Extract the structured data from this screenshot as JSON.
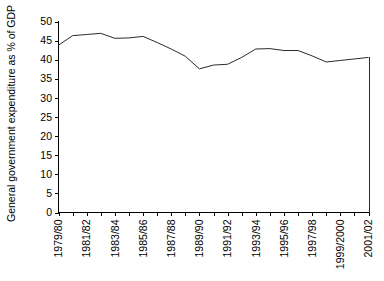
{
  "chart_data": {
    "type": "line",
    "title": "",
    "xlabel": "",
    "ylabel": "General government expenditure as % of GDP",
    "ylim": [
      0,
      50
    ],
    "y_ticks": [
      0,
      5,
      10,
      15,
      20,
      25,
      30,
      35,
      40,
      45,
      50
    ],
    "y_tick_labels": [
      "0",
      "5",
      "10",
      "15",
      "20",
      "25",
      "30",
      "35",
      "40",
      "45",
      "50"
    ],
    "grid": false,
    "legend": false,
    "legend_position": "none",
    "line_color": "#2b2b2b",
    "axis_color": "#000000",
    "x": [
      "1979/80",
      "1980/81",
      "1981/82",
      "1982/83",
      "1983/84",
      "1984/85",
      "1985/86",
      "1986/87",
      "1987/88",
      "1988/89",
      "1989/90",
      "1990/91",
      "1991/92",
      "1992/93",
      "1993/94",
      "1994/95",
      "1995/96",
      "1996/97",
      "1997/98",
      "1998/99",
      "1999/2000",
      "2000/01",
      "2001/02"
    ],
    "values": [
      43.8,
      46.3,
      46.6,
      46.9,
      45.6,
      45.7,
      46.1,
      44.5,
      42.8,
      40.9,
      37.6,
      38.6,
      38.8,
      40.6,
      42.8,
      42.9,
      42.4,
      42.4,
      41.0,
      39.4,
      39.8,
      40.2,
      40.6
    ],
    "x_tick_labels": [
      "1979/80",
      "1981/82",
      "1983/84",
      "1985/86",
      "1987/88",
      "1989/90",
      "1991/92",
      "1993/94",
      "1995/96",
      "1997/98",
      "1999/2000",
      "2001/02"
    ],
    "x_tick_label_indices": [
      0,
      2,
      4,
      6,
      8,
      10,
      12,
      14,
      16,
      18,
      20,
      22
    ],
    "x_tick_label_rotation": -90,
    "series": [
      {
        "name": "General government expenditure as % of GDP",
        "values": [
          43.8,
          46.3,
          46.6,
          46.9,
          45.6,
          45.7,
          46.1,
          44.5,
          42.8,
          40.9,
          37.6,
          38.6,
          38.8,
          40.6,
          42.8,
          42.9,
          42.4,
          42.4,
          41.0,
          39.4,
          39.8,
          40.2,
          40.6
        ]
      }
    ]
  }
}
